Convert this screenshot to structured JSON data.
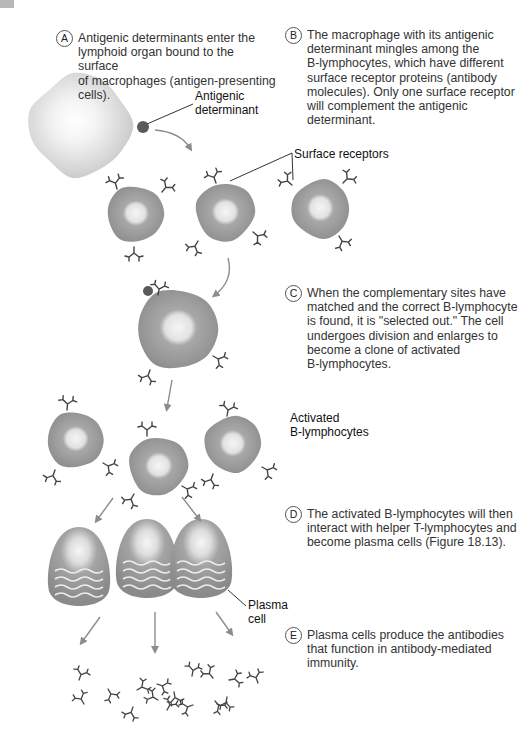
{
  "steps": [
    {
      "letter": "A",
      "text": "Antigenic determinants enter the\nlymphoid organ bound to the surface\nof macrophages (antigen-presenting\ncells)."
    },
    {
      "letter": "B",
      "text": "The macrophage with its antigenic\ndeterminant mingles among the\nB-lymphocytes, which have different\nsurface receptor proteins (antibody\nmolecules). Only one surface receptor\nwill complement the antigenic determinant."
    },
    {
      "letter": "C",
      "text": "When the complementary sites have\nmatched and the correct B-lymphocyte\nis found, it is \"selected out.\" The cell\nundergoes division and enlarges to\nbecome a clone of activated\nB-lymphocytes."
    },
    {
      "letter": "D",
      "text": "The activated B-lymphocytes will then\ninteract with helper T-lymphocytes and\nbecome plasma cells (Figure 18.13)."
    },
    {
      "letter": "E",
      "text": "Plasma cells produce the antibodies\nthat function in antibody-mediated\nimmunity."
    }
  ],
  "labels": {
    "antigenic_determinant": "Antigenic\ndeterminant",
    "surface_receptors": "Surface receptors",
    "activated_b_lymphocytes": "Activated\nB-lymphocytes",
    "plasma_cell": "Plasma\ncell"
  },
  "colors": {
    "macrophage": "#d6d6d6",
    "lymphocyte": "#9a9a9a",
    "nucleus": "#e6e6e6",
    "antigen": "#5a5a5a",
    "arrow": "#8c8c8c",
    "receptor": "#444444"
  }
}
